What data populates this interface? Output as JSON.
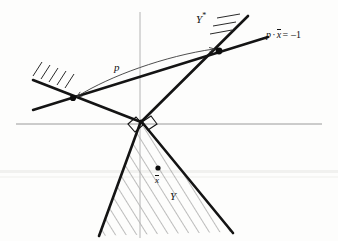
{
  "figure": {
    "labels": {
      "polar_cone": "Y",
      "polar_cone_star": "*",
      "hyperplane_lhs_p": "p",
      "hyperplane_dot": "·",
      "hyperplane_x": "x",
      "hyperplane_eq": "= –1",
      "vector_p": "p",
      "point_xbar": "x",
      "cone": "Y"
    },
    "colors": {
      "ink": "#111111",
      "axis": "#8d8d8d",
      "hatch": "#6e6e6e",
      "arrow": "#333333",
      "background": "#fdfdfc"
    },
    "geometry": {
      "axis_horizontal_y": 124,
      "axis_horizontal_x1": 16,
      "axis_horizontal_x2": 322,
      "axis_vertical_x": 140,
      "axis_vertical_y1": 12,
      "axis_vertical_y2": 238,
      "apex_x": 140,
      "apex_y": 122,
      "cone_left_x": 100,
      "cone_left_y": 233,
      "cone_right_x": 229,
      "cone_right_y": 228,
      "tangency_left_x": 72,
      "tangency_left_y": 98,
      "tangency_right_x": 219,
      "tangency_right_y": 51,
      "point_xbar_x": 158,
      "point_xbar_y": 168
    }
  }
}
